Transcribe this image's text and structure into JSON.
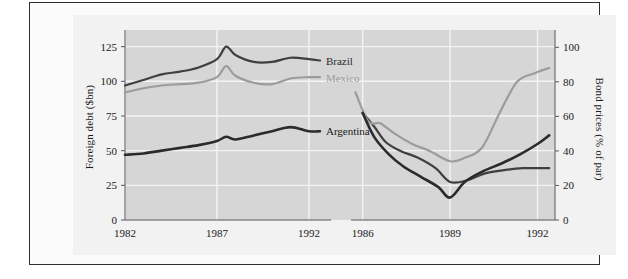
{
  "figure": {
    "background_color": "#f2f2f2",
    "frame_color": "#2f2f2f"
  },
  "chart_data": {
    "type": "line",
    "title": "",
    "subtitle": "",
    "panels": [
      {
        "name": "foreign-debt-panel",
        "ylabel": "Foreign debt ($bn)",
        "xlabel": "",
        "ylim": [
          0,
          137
        ],
        "yticks": [
          0,
          25,
          50,
          75,
          100,
          125
        ],
        "ytick_labels": [
          "0",
          "25",
          "50",
          "75",
          "100",
          "125"
        ],
        "xlim": [
          1982,
          1993.2
        ],
        "xticks": [
          1982,
          1987,
          1992
        ],
        "xtick_labels": [
          "1982",
          "1987",
          "1992"
        ],
        "grid": true,
        "series": [
          {
            "name": "Brazil",
            "color": "#3f3f3f",
            "x": [
              1982,
              1983,
              1984,
              1985,
              1986,
              1987,
              1987.5,
              1988,
              1989,
              1990,
              1991,
              1992,
              1992.6
            ],
            "values": [
              97,
              101,
              105,
              107,
              110,
              116,
              125,
              119,
              114,
              114,
              117,
              116,
              115
            ]
          },
          {
            "name": "Mexico",
            "color": "#9c9c9c",
            "x": [
              1982,
              1983,
              1984,
              1985,
              1986,
              1987,
              1987.5,
              1988,
              1989,
              1990,
              1991,
              1992,
              1992.6
            ],
            "values": [
              92,
              95,
              97,
              98,
              99,
              103,
              111,
              104,
              99,
              98,
              102,
              103,
              103
            ]
          },
          {
            "name": "Argentina",
            "color": "#2b2b2b",
            "x": [
              1982,
              1983,
              1984,
              1985,
              1986,
              1987,
              1987.5,
              1988,
              1989,
              1990,
              1991,
              1992,
              1992.6
            ],
            "values": [
              47,
              48,
              50,
              52,
              54,
              57,
              60,
              58,
              61,
              64,
              67,
              64,
              64
            ]
          }
        ]
      },
      {
        "name": "bond-prices-panel",
        "ylabel": "Bond prices (% of par)",
        "xlabel": "",
        "ylim": [
          0,
          110
        ],
        "yticks": [
          0,
          20,
          40,
          60,
          80,
          100
        ],
        "ytick_labels": [
          "0",
          "20",
          "40",
          "60",
          "80",
          "100"
        ],
        "xlim": [
          1985.6,
          1992.6
        ],
        "xticks": [
          1986,
          1989,
          1992
        ],
        "xtick_labels": [
          "1986",
          "1989",
          "1992"
        ],
        "grid": true,
        "series": [
          {
            "name": "Brazil",
            "color": "#3f3f3f",
            "x": [
              1986,
              1986.4,
              1986.8,
              1987.3,
              1987.9,
              1988.5,
              1989,
              1989.6,
              1990.2,
              1990.9,
              1991.5,
              1992,
              1992.4
            ],
            "values": [
              62,
              54,
              45,
              40,
              36,
              30,
              22,
              23,
              27,
              29,
              30,
              30,
              30
            ]
          },
          {
            "name": "Mexico",
            "color": "#9c9c9c",
            "x": [
              1985.75,
              1986.2,
              1986.6,
              1987.1,
              1987.7,
              1988.3,
              1989,
              1989.5,
              1990.1,
              1990.7,
              1991.3,
              1991.9,
              1992.4
            ],
            "values": [
              74,
              57,
              56,
              50,
              44,
              40,
              34,
              36,
              42,
              62,
              80,
              85,
              88
            ]
          },
          {
            "name": "Argentina",
            "color": "#2b2b2b",
            "x": [
              1986,
              1986.4,
              1986.9,
              1987.4,
              1988,
              1988.6,
              1989,
              1989.5,
              1990.1,
              1990.8,
              1991.4,
              1992,
              1992.4
            ],
            "values": [
              62,
              48,
              38,
              31,
              25,
              19,
              13,
              22,
              28,
              33,
              38,
              44,
              49
            ]
          }
        ]
      }
    ],
    "annotations": [
      {
        "label": "Brazil",
        "color": "#2b2b2b",
        "panel": "left"
      },
      {
        "label": "Mexico",
        "color": "#9c9c9c",
        "panel": "left"
      },
      {
        "label": "Argentina",
        "color": "#1a1a1a",
        "panel": "left"
      }
    ],
    "legend_position": "inline-right-of-curve",
    "axis_break": true
  }
}
